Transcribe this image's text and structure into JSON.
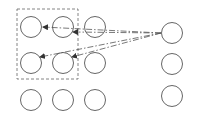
{
  "diagram": {
    "background": "#ffffff",
    "stroke_color": "#555555",
    "group_box": {
      "x": 17,
      "y": 9,
      "w": 61,
      "h": 70
    },
    "grid_nodes": [
      {
        "id": "r1c1",
        "cx": 31,
        "cy": 27,
        "r": 10.5
      },
      {
        "id": "r1c2",
        "cx": 63,
        "cy": 27,
        "r": 10.5
      },
      {
        "id": "r1c3",
        "cx": 95,
        "cy": 27,
        "r": 10.5
      },
      {
        "id": "r2c1",
        "cx": 31,
        "cy": 63,
        "r": 10.5
      },
      {
        "id": "r2c2",
        "cx": 63,
        "cy": 63,
        "r": 10.5
      },
      {
        "id": "r2c3",
        "cx": 95,
        "cy": 63,
        "r": 10.5
      },
      {
        "id": "r3c1",
        "cx": 31,
        "cy": 100,
        "r": 10.5
      },
      {
        "id": "r3c2",
        "cx": 63,
        "cy": 100,
        "r": 10.5
      },
      {
        "id": "r3c3",
        "cx": 95,
        "cy": 100,
        "r": 10.5
      }
    ],
    "right_nodes": [
      {
        "id": "s1",
        "cx": 172,
        "cy": 33,
        "r": 10.5
      },
      {
        "id": "s2",
        "cx": 172,
        "cy": 64,
        "r": 10.5
      },
      {
        "id": "s3",
        "cx": 172,
        "cy": 96,
        "r": 10.5
      }
    ],
    "arrows": [
      {
        "from": "s1",
        "to": "r1c1",
        "x1": 161,
        "y1": 33,
        "x2": 43,
        "y2": 27
      },
      {
        "from": "s1",
        "to": "r1c2",
        "x1": 161,
        "y1": 33,
        "x2": 73,
        "y2": 32
      },
      {
        "from": "s1",
        "to": "r2c1",
        "x1": 161,
        "y1": 33,
        "x2": 40,
        "y2": 57
      },
      {
        "from": "s1",
        "to": "r2c2",
        "x1": 161,
        "y1": 33,
        "x2": 72,
        "y2": 57
      }
    ]
  }
}
